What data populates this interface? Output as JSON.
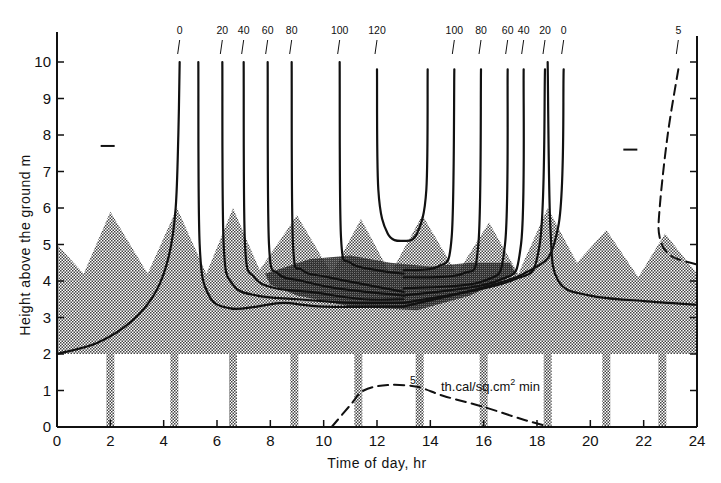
{
  "chart_data": {
    "type": "line",
    "title": "",
    "xlabel": "Time of day, hr",
    "ylabel": "Height above the ground   m",
    "xlim": [
      0,
      24
    ],
    "ylim": [
      0,
      10.5
    ],
    "x_ticks": [
      0,
      2,
      4,
      6,
      8,
      10,
      12,
      14,
      16,
      18,
      20,
      22,
      24
    ],
    "y_ticks": [
      0,
      1,
      2,
      3,
      4,
      5,
      6,
      7,
      8,
      9,
      10
    ],
    "grid": false,
    "legend": null,
    "shaded_region": {
      "description": "Stippled band (canopy/layer) from ~2 m up to a sawtooth top between ~4.2 and ~6 m",
      "base_height_m": 2.0,
      "top_profile": [
        {
          "x": 0,
          "y": 5.0
        },
        {
          "x": 1,
          "y": 4.2
        },
        {
          "x": 2,
          "y": 5.9
        },
        {
          "x": 3.4,
          "y": 4.2
        },
        {
          "x": 4.5,
          "y": 6.0
        },
        {
          "x": 5.6,
          "y": 4.2
        },
        {
          "x": 6.6,
          "y": 6.0
        },
        {
          "x": 7.6,
          "y": 4.3
        },
        {
          "x": 9.0,
          "y": 5.8
        },
        {
          "x": 10.3,
          "y": 4.2
        },
        {
          "x": 11.4,
          "y": 5.7
        },
        {
          "x": 12.5,
          "y": 4.2
        },
        {
          "x": 13.7,
          "y": 5.8
        },
        {
          "x": 15.0,
          "y": 4.2
        },
        {
          "x": 16.2,
          "y": 5.6
        },
        {
          "x": 17.3,
          "y": 4.2
        },
        {
          "x": 18.4,
          "y": 6.0
        },
        {
          "x": 19.5,
          "y": 4.5
        },
        {
          "x": 20.6,
          "y": 5.4
        },
        {
          "x": 21.8,
          "y": 4.1
        },
        {
          "x": 22.8,
          "y": 5.3
        },
        {
          "x": 24,
          "y": 4.2
        }
      ],
      "vertical_bars_x": [
        2.0,
        4.4,
        6.6,
        8.9,
        11.3,
        13.6,
        16.0,
        18.4,
        20.6,
        22.7
      ]
    },
    "series": [
      {
        "name": "0 (morning)",
        "label": "0",
        "style": "solid",
        "points": [
          [
            0,
            2.0
          ],
          [
            1.5,
            2.3
          ],
          [
            2.8,
            2.9
          ],
          [
            3.7,
            3.7
          ],
          [
            4.2,
            4.7
          ],
          [
            4.45,
            6.0
          ],
          [
            4.55,
            8.0
          ],
          [
            4.6,
            10.0
          ]
        ]
      },
      {
        "name": "0 (morning, lower branch)",
        "label": "",
        "style": "solid",
        "points": [
          [
            5.3,
            10.0
          ],
          [
            5.35,
            5.0
          ],
          [
            5.7,
            3.6
          ],
          [
            6.5,
            3.25
          ],
          [
            7.5,
            3.3
          ],
          [
            8.5,
            3.4
          ],
          [
            10,
            3.3
          ],
          [
            13,
            3.3
          ]
        ]
      },
      {
        "name": "20 (morning)",
        "label": "20",
        "style": "solid",
        "points": [
          [
            6.2,
            10.0
          ],
          [
            6.25,
            5.0
          ],
          [
            6.6,
            3.9
          ],
          [
            7.5,
            3.6
          ],
          [
            9,
            3.5
          ],
          [
            11,
            3.4
          ],
          [
            13,
            3.4
          ]
        ]
      },
      {
        "name": "40 (morning)",
        "label": "40",
        "style": "solid",
        "points": [
          [
            7.0,
            10.0
          ],
          [
            7.05,
            5.0
          ],
          [
            7.4,
            4.1
          ],
          [
            8.2,
            3.8
          ],
          [
            9.5,
            3.7
          ],
          [
            11.5,
            3.5
          ],
          [
            13,
            3.5
          ]
        ]
      },
      {
        "name": "60 (morning)",
        "label": "60",
        "style": "solid",
        "points": [
          [
            7.9,
            10.0
          ],
          [
            7.95,
            5.0
          ],
          [
            8.3,
            4.2
          ],
          [
            9.2,
            4.0
          ],
          [
            10.5,
            3.8
          ],
          [
            13,
            3.6
          ]
        ]
      },
      {
        "name": "80 (morning)",
        "label": "80",
        "style": "solid",
        "points": [
          [
            8.8,
            10.0
          ],
          [
            8.85,
            5.0
          ],
          [
            9.2,
            4.3
          ],
          [
            10.2,
            4.1
          ],
          [
            13,
            3.7
          ]
        ]
      },
      {
        "name": "100 (morning)",
        "label": "100",
        "style": "solid",
        "points": [
          [
            10.6,
            10.0
          ],
          [
            10.65,
            5.2
          ],
          [
            11.0,
            4.5
          ],
          [
            12.0,
            4.3
          ],
          [
            13,
            4.2
          ]
        ]
      },
      {
        "name": "120",
        "label": "120",
        "style": "solid",
        "points": [
          [
            12.0,
            9.8
          ],
          [
            12.05,
            6.5
          ],
          [
            12.4,
            5.3
          ],
          [
            13.0,
            5.1
          ],
          [
            13.5,
            5.3
          ],
          [
            13.85,
            6.5
          ],
          [
            13.9,
            9.8
          ]
        ]
      },
      {
        "name": "100 (afternoon)",
        "label": "100",
        "style": "solid",
        "points": [
          [
            13,
            4.3
          ],
          [
            14.3,
            4.4
          ],
          [
            14.8,
            5.2
          ],
          [
            14.9,
            9.8
          ]
        ]
      },
      {
        "name": "80 (afternoon)",
        "label": "80",
        "style": "solid",
        "points": [
          [
            13,
            4.1
          ],
          [
            15.2,
            4.2
          ],
          [
            15.8,
            5.0
          ],
          [
            15.9,
            9.8
          ]
        ]
      },
      {
        "name": "60 (afternoon)",
        "label": "60",
        "style": "solid",
        "points": [
          [
            13,
            3.8
          ],
          [
            16,
            4.0
          ],
          [
            16.8,
            5.0
          ],
          [
            16.9,
            9.8
          ]
        ]
      },
      {
        "name": "40 (afternoon)",
        "label": "40",
        "style": "solid",
        "points": [
          [
            13,
            3.6
          ],
          [
            16.5,
            4.0
          ],
          [
            17.4,
            5.0
          ],
          [
            17.5,
            9.8
          ]
        ]
      },
      {
        "name": "20 (afternoon)",
        "label": "20",
        "style": "solid",
        "points": [
          [
            13,
            3.4
          ],
          [
            17,
            4.0
          ],
          [
            18.1,
            5.0
          ],
          [
            18.3,
            9.8
          ]
        ]
      },
      {
        "name": "0 (afternoon)",
        "label": "0",
        "style": "solid",
        "points": [
          [
            13,
            3.3
          ],
          [
            17.5,
            4.2
          ],
          [
            18.8,
            5.5
          ],
          [
            19.0,
            9.8
          ]
        ]
      },
      {
        "name": "0 (evening, descending)",
        "label": "",
        "style": "solid",
        "points": [
          [
            18.4,
            10.0
          ],
          [
            18.5,
            5.5
          ],
          [
            18.8,
            4.0
          ],
          [
            20,
            3.6
          ],
          [
            22,
            3.45
          ],
          [
            24,
            3.35
          ]
        ]
      },
      {
        "name": "5 (night, dashed)",
        "label": "5",
        "style": "dashed",
        "points": [
          [
            23.3,
            9.8
          ],
          [
            22.9,
            8.0
          ],
          [
            22.6,
            6.0
          ],
          [
            22.6,
            5.2
          ],
          [
            23.0,
            4.7
          ],
          [
            24,
            4.45
          ]
        ]
      },
      {
        "name": "Radiation 5 th.cal/sq.cm² min (dashed)",
        "label": "5",
        "style": "dashed",
        "points": [
          [
            10.3,
            0.0
          ],
          [
            11.0,
            0.6
          ],
          [
            11.5,
            1.0
          ],
          [
            12.4,
            1.15
          ],
          [
            13.5,
            1.1
          ],
          [
            14.5,
            0.85
          ],
          [
            16.0,
            0.55
          ],
          [
            17.5,
            0.2
          ],
          [
            18.5,
            0.0
          ]
        ]
      }
    ],
    "annotations": [
      {
        "text": "th.cal/sq.cm² min",
        "x": 14.4,
        "y": 1.15
      },
      {
        "text": "5",
        "x": 13.0,
        "y": 1.3
      },
      {
        "text": "—",
        "x": 1.9,
        "y": 7.7
      },
      {
        "text": "—",
        "x": 21.5,
        "y": 7.6
      }
    ],
    "top_labels_left": [
      "0",
      "20",
      "40",
      "60",
      "80",
      "100",
      "120"
    ],
    "top_labels_right": [
      "100",
      "80",
      "60",
      "40",
      "20",
      "0",
      "5"
    ]
  },
  "labels": {
    "xlabel": "Time of day,  hr",
    "ylabel": "Height above the ground     m",
    "unit_annotation": "th.cal/sq.cm",
    "unit_sup": "2",
    "unit_suffix": " min",
    "radiation_iso_label": "5"
  }
}
